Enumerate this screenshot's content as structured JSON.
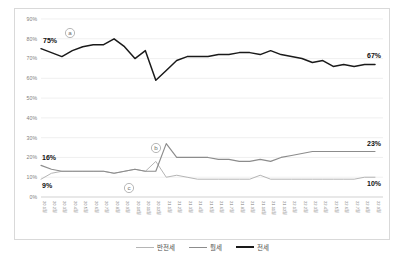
{
  "chart_data": {
    "type": "line",
    "title": "",
    "xlabel": "",
    "ylabel": "",
    "ylim": [
      0,
      90
    ],
    "ytick_labels": [
      "90%",
      "80%",
      "70%",
      "60%",
      "50%",
      "40%",
      "30%",
      "20%",
      "10%",
      "0%"
    ],
    "ytick_values": [
      90,
      80,
      70,
      60,
      50,
      40,
      30,
      20,
      10,
      0
    ],
    "grid": true,
    "legend_position": "bottom-center",
    "categories": [
      "20.1월",
      "20.2월",
      "20.3월",
      "20.4월",
      "20.5월",
      "20.6월",
      "20.7월",
      "20.8월",
      "20.9월",
      "20.10월",
      "20.11월",
      "20.12월",
      "21.1월",
      "21.2월",
      "21.3월",
      "21.4월",
      "21.5월",
      "21.6월",
      "21.7월",
      "21.8월",
      "21.9월",
      "21.10월",
      "21.11월",
      "21.12월",
      "22.1월",
      "22.2월",
      "22.3월",
      "22.4월",
      "22.5월",
      "22.6월",
      "22.7월",
      "22.8월",
      "22.9월"
    ],
    "series": [
      {
        "name": "전세",
        "color": "#1a1a1a",
        "values": [
          75,
          73,
          71,
          74,
          76,
          77,
          77,
          80,
          76,
          70,
          74,
          59,
          64,
          69,
          71,
          71,
          71,
          72,
          72,
          73,
          73,
          72,
          74,
          72,
          71,
          70,
          68,
          69,
          66,
          67,
          66,
          67,
          67
        ]
      },
      {
        "name": "월세",
        "color": "#8c8c8c",
        "values": [
          16,
          14,
          13,
          13,
          13,
          13,
          13,
          12,
          13,
          14,
          13,
          13,
          27,
          20,
          20,
          20,
          20,
          19,
          19,
          18,
          18,
          19,
          18,
          20,
          21,
          22,
          23,
          23,
          23,
          23,
          23,
          23,
          23
        ]
      },
      {
        "name": "반전세",
        "color": "#b5b5b5",
        "values": [
          9,
          12,
          13,
          13,
          13,
          13,
          13,
          12,
          13,
          14,
          13,
          18,
          10,
          11,
          10,
          9,
          9,
          9,
          9,
          9,
          9,
          11,
          9,
          9,
          9,
          9,
          9,
          9,
          9,
          9,
          9,
          10,
          10
        ]
      }
    ],
    "data_labels": [
      {
        "id": "jeonse-start",
        "text": "75%",
        "series": "전세",
        "position": "start"
      },
      {
        "id": "jeonse-end",
        "text": "67%",
        "series": "전세",
        "position": "end"
      },
      {
        "id": "wolse-start",
        "text": "16%",
        "series": "월세",
        "position": "start"
      },
      {
        "id": "wolse-end",
        "text": "23%",
        "series": "월세",
        "position": "end"
      },
      {
        "id": "banjeonse-start",
        "text": "9%",
        "series": "반전세",
        "position": "start"
      },
      {
        "id": "banjeonse-end",
        "text": "10%",
        "series": "반전세",
        "position": "end"
      }
    ],
    "annotations": [
      {
        "id": "a",
        "text": "ⓐ",
        "x": 69,
        "y": 32
      },
      {
        "id": "b",
        "text": "ⓑ",
        "x": 155,
        "y": 147
      },
      {
        "id": "c",
        "text": "ⓒ",
        "x": 128,
        "y": 187
      }
    ]
  },
  "legend": {
    "items": [
      {
        "label": "반전세",
        "color": "#b5b5b5"
      },
      {
        "label": "월세",
        "color": "#8c8c8c"
      },
      {
        "label": "전세",
        "color": "#1a1a1a"
      }
    ]
  }
}
